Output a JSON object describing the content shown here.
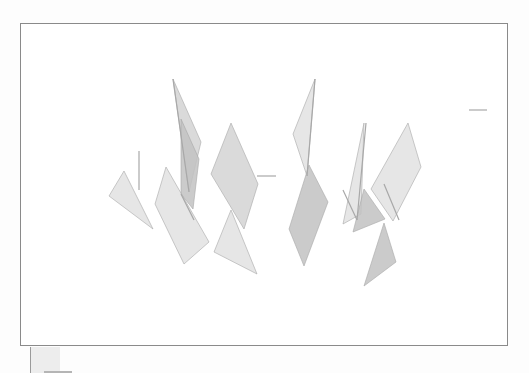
{
  "viewport": {
    "label": "3D canvas viewport",
    "border_color": "#8a8a8a",
    "background": "#ffffff"
  },
  "scene": {
    "fill_light": "#e2e2e2",
    "fill_mid": "#d3d3d3",
    "fill_dark": "#c2c2c2",
    "edge_color": "#a8a8a8",
    "shapes": [
      {
        "name": "left-triangle",
        "points": "103,147 88,172 132,205",
        "shade": "light"
      },
      {
        "name": "tall-left-sliver",
        "points": "152,55 180,118 168,168",
        "shade": "mid"
      },
      {
        "name": "left-center-quad",
        "points": "160,95 178,135 172,185 160,170",
        "shade": "dark"
      },
      {
        "name": "left-lower-quad",
        "points": "145,143 188,218 163,240 134,180",
        "shade": "light"
      },
      {
        "name": "center-diamond",
        "points": "210,99 237,160 223,205 190,150",
        "shade": "mid"
      },
      {
        "name": "center-lower-triangle",
        "points": "210,186 236,250 193,228",
        "shade": "light"
      },
      {
        "name": "right-tall-sliver",
        "points": "294,55 286,152 272,110",
        "shade": "light"
      },
      {
        "name": "right-diamond",
        "points": "288,141 307,178 283,242 268,205",
        "shade": "dark"
      },
      {
        "name": "right-mid-triangle",
        "points": "343,99 340,190 322,200",
        "shade": "light"
      },
      {
        "name": "right-mid-dark",
        "points": "343,165 364,195 332,208",
        "shade": "dark"
      },
      {
        "name": "right-far-diamond",
        "points": "387,99 400,143 372,197 350,165",
        "shade": "light"
      },
      {
        "name": "right-lower-triangle",
        "points": "363,199 375,238 343,262",
        "shade": "dark"
      }
    ],
    "lines": [
      {
        "name": "left-vertical-stroke",
        "x1": 118,
        "y1": 127,
        "x2": 118,
        "y2": 166
      },
      {
        "name": "sliver-edge-left",
        "x1": 152,
        "y1": 55,
        "x2": 168,
        "y2": 168
      },
      {
        "name": "quad-edge",
        "x1": 160,
        "y1": 170,
        "x2": 173,
        "y2": 196
      },
      {
        "name": "right-sliver-edge",
        "x1": 294,
        "y1": 55,
        "x2": 286,
        "y2": 152
      },
      {
        "name": "right-mid-edge",
        "x1": 345,
        "y1": 99,
        "x2": 336,
        "y2": 196
      },
      {
        "name": "right-mid-diagonal",
        "x1": 322,
        "y1": 166,
        "x2": 336,
        "y2": 196
      },
      {
        "name": "right-far-edge",
        "x1": 363,
        "y1": 160,
        "x2": 378,
        "y2": 196
      },
      {
        "name": "dash-center",
        "x1": 236,
        "y1": 152,
        "x2": 255,
        "y2": 152
      },
      {
        "name": "dash-right",
        "x1": 448,
        "y1": 86,
        "x2": 466,
        "y2": 86
      }
    ]
  },
  "below_widget": {
    "label": "small panel below viewport"
  }
}
